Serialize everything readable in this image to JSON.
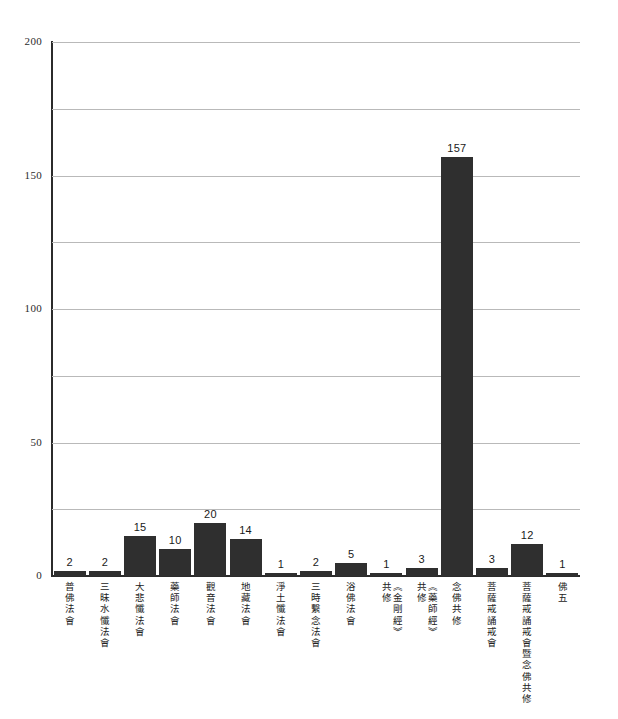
{
  "chart_data": {
    "type": "bar",
    "title": "",
    "subtitle": "",
    "xlabel": "",
    "ylabel": "",
    "ylim": [
      0,
      200
    ],
    "y_ticks": [
      0,
      50,
      100,
      150,
      200
    ],
    "y_gridlines": [
      25,
      50,
      75,
      100,
      125,
      150,
      175,
      200
    ],
    "grid": true,
    "legend": "none",
    "bar_color": "#2f2f2f",
    "gridline_color": "#b9b9b9",
    "axis_color": "#2b2b2b",
    "categories": [
      "普佛法會",
      "三昧水懺法會",
      "大悲懺法會",
      "藥師法會",
      "觀音法會",
      "地藏法會",
      "淨土懺法會",
      "三時繫念法會",
      "浴佛法會",
      "《金剛經》共修",
      "《藥師經》共修",
      "念佛共修",
      "菩薩戒誦戒會",
      "菩薩戒誦戒會暨念佛共修",
      "佛五"
    ],
    "category_lines": [
      [
        "普佛法會"
      ],
      [
        "三昧水懺法會"
      ],
      [
        "大悲懺法會"
      ],
      [
        "藥師法會"
      ],
      [
        "觀音法會"
      ],
      [
        "地藏法會"
      ],
      [
        "淨土懺法會"
      ],
      [
        "三時繫念法會"
      ],
      [
        "浴佛法會"
      ],
      [
        "《金剛經》",
        "共修"
      ],
      [
        "《藥師經》",
        "共修"
      ],
      [
        "念佛共修"
      ],
      [
        "菩薩戒誦戒會"
      ],
      [
        "菩薩戒誦戒會暨念佛共修"
      ],
      [
        "佛五"
      ]
    ],
    "values": [
      2,
      2,
      15,
      10,
      20,
      14,
      1,
      2,
      5,
      1,
      3,
      157,
      3,
      12,
      1
    ],
    "value_labels": [
      "2",
      "2",
      "15",
      "10",
      "20",
      "14",
      "1",
      "2",
      "5",
      "1",
      "3",
      "157",
      "3",
      "12",
      "1"
    ],
    "y_tick_labels": [
      "0",
      "50",
      "100",
      "150",
      "200"
    ]
  }
}
